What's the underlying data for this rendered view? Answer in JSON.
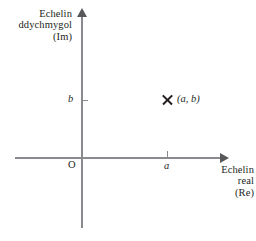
{
  "chart_data": {
    "type": "scatter",
    "title": "",
    "xlabel": "Echelin real (Re)",
    "ylabel": "Echelin ddychmygol (Im)",
    "grid": false,
    "legend": false,
    "origin_label": "O",
    "x_tick_labels": [
      "a"
    ],
    "y_tick_labels": [
      "b"
    ],
    "points": [
      {
        "label": "(a, b)",
        "x": "a",
        "y": "b",
        "marker": "x"
      }
    ],
    "colors": {
      "axis": "#8a8a8e",
      "text": "#231f20",
      "background": "#ffffff"
    }
  },
  "diagram": {
    "y_axis_caption": {
      "line1": "Echelin",
      "line2": "ddychmygol",
      "line3": "(Im)"
    },
    "x_axis_caption": {
      "line1": "Echelin",
      "line2": "real",
      "line3": "(Re)"
    },
    "origin": "O",
    "x_tick": "a",
    "y_tick": "b",
    "point_label": "(a, b)"
  }
}
